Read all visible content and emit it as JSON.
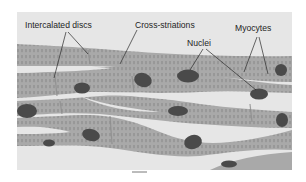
{
  "diagram": {
    "labels": {
      "intercalated_discs": "Intercalated discs",
      "cross_striations": "Cross-striations",
      "nuclei": "Nuclei",
      "myocytes": "Myocytes"
    },
    "colors": {
      "background_panel": "#e6e6e6",
      "fiber": "#a9a9a9",
      "striation": "#6f6f6f",
      "nucleus": "#4a4a4a",
      "leader_line": "#2a2a2a",
      "page": "#ffffff"
    }
  }
}
